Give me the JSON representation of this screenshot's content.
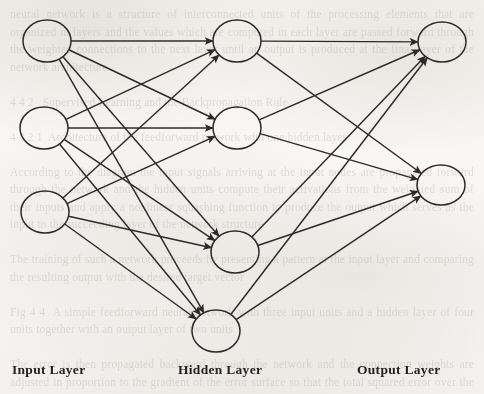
{
  "diagram": {
    "type": "feedforward-neural-network",
    "topology": [
      3,
      4,
      2
    ],
    "fully_connected": true,
    "stroke_color": "#2b2b2b",
    "node_fill": "none",
    "layers": [
      {
        "id": "input",
        "label": "Input Layer",
        "node_count": 3,
        "node_rx": 24,
        "node_ry": 21,
        "nodes": [
          {
            "id": "i1",
            "cx": 47,
            "cy": 41
          },
          {
            "id": "i2",
            "cx": 44,
            "cy": 128
          },
          {
            "id": "i3",
            "cx": 45,
            "cy": 212
          }
        ]
      },
      {
        "id": "hidden",
        "label": "Hidden Layer",
        "node_count": 4,
        "node_rx": 24,
        "node_ry": 21,
        "nodes": [
          {
            "id": "h1",
            "cx": 237,
            "cy": 41
          },
          {
            "id": "h2",
            "cx": 237,
            "cy": 128
          },
          {
            "id": "h3",
            "cx": 235,
            "cy": 252
          },
          {
            "id": "h4",
            "cx": 216,
            "cy": 331
          }
        ]
      },
      {
        "id": "output",
        "label": "Output Layer",
        "node_count": 2,
        "node_rx": 24,
        "node_ry": 20,
        "nodes": [
          {
            "id": "o1",
            "cx": 442,
            "cy": 42
          },
          {
            "id": "o2",
            "cx": 441,
            "cy": 185
          }
        ]
      }
    ],
    "edges": [
      {
        "from": "i1",
        "to": "h1"
      },
      {
        "from": "i1",
        "to": "h2"
      },
      {
        "from": "i1",
        "to": "h3"
      },
      {
        "from": "i1",
        "to": "h4"
      },
      {
        "from": "i2",
        "to": "h1"
      },
      {
        "from": "i2",
        "to": "h2"
      },
      {
        "from": "i2",
        "to": "h3"
      },
      {
        "from": "i2",
        "to": "h4"
      },
      {
        "from": "i3",
        "to": "h1"
      },
      {
        "from": "i3",
        "to": "h2"
      },
      {
        "from": "i3",
        "to": "h3"
      },
      {
        "from": "i3",
        "to": "h4"
      },
      {
        "from": "h1",
        "to": "o1"
      },
      {
        "from": "h1",
        "to": "o2"
      },
      {
        "from": "h2",
        "to": "o1"
      },
      {
        "from": "h2",
        "to": "o2"
      },
      {
        "from": "h3",
        "to": "o1"
      },
      {
        "from": "h3",
        "to": "o2"
      },
      {
        "from": "h4",
        "to": "o1"
      },
      {
        "from": "h4",
        "to": "o2"
      }
    ]
  },
  "background": {
    "bleed_text": "neural network is a structure of interconnected units of the processing elements that are organized in layers and the values which are computed in each layer are passed forward through the weighted connections to the next layer until an output is produced at the final layer of the network architecture\n\n4 4 2   Supervised Learning and the Backpropagation Rule\n\n4 4 2 1  Architecture of the feedforward network with one hidden layer\n\nAccording to the diagram the input signals arriving at the input nodes are propagated forward through the network and the hidden units compute their activations from the weighted sum of their inputs and apply a nonlinear squashing function to produce the output which serves as the input to the succeeding layer of the network structure\n\nThe training of such a network proceeds by presenting a pattern at the input layer and comparing the resulting output with the desired target vector\n\nFig 4 4  A simple feedforward neural network with three input units and a hidden layer of four units together with an output layer of two units\n\nThe error is then propagated backward through the network and the connection weights are adjusted in proportion to the gradient of the error surface so that the total squared error over the set of training patterns is progressively reduced toward a minimum in the weight space of the model"
  }
}
